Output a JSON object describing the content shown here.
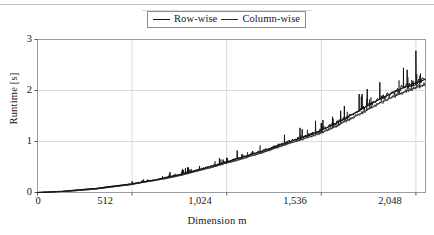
{
  "figure": {
    "background": "#ffffff",
    "frame_color": "#9a9da1",
    "grid_color": "#d9dbdd",
    "series_color_row": "#141414",
    "series_color_col": "#2d2d2d"
  },
  "legend": {
    "entries": [
      {
        "label": "Row-wise",
        "marker": "line-sample"
      },
      {
        "label": "Column-wise",
        "marker": "line-sample"
      }
    ]
  },
  "axes": {
    "y": {
      "label": "Runtime [s]",
      "ticks": [
        "0",
        "1",
        "2",
        "3"
      ]
    },
    "x": {
      "label": "Dimension m",
      "ticks": [
        "0",
        "512",
        "1,024",
        "1,536",
        "2,048"
      ]
    }
  },
  "chart_data": {
    "type": "line",
    "title": "",
    "xlabel": "Dimension m",
    "ylabel": "Runtime [s]",
    "xlim": [
      0,
      2100
    ],
    "ylim": [
      0,
      3
    ],
    "xticks": [
      0,
      512,
      1024,
      1536,
      2048
    ],
    "xticklabels": [
      "0",
      "512",
      "1,024",
      "1,536",
      "2,048"
    ],
    "yticks": [
      0,
      1,
      2,
      3
    ],
    "yticklabels": [
      "0",
      "1",
      "2",
      "3"
    ],
    "grid": true,
    "legend_position": "top-center-outside",
    "series": [
      {
        "name": "Row-wise",
        "color": "#141414",
        "x": [
          0,
          64,
          128,
          192,
          256,
          320,
          384,
          448,
          512,
          576,
          640,
          704,
          768,
          832,
          896,
          960,
          1024,
          1088,
          1152,
          1216,
          1280,
          1344,
          1408,
          1472,
          1536,
          1600,
          1664,
          1728,
          1792,
          1856,
          1920,
          1984,
          2048,
          2100
        ],
        "values": [
          0.0,
          0.01,
          0.02,
          0.04,
          0.06,
          0.08,
          0.11,
          0.14,
          0.17,
          0.21,
          0.25,
          0.3,
          0.35,
          0.41,
          0.47,
          0.53,
          0.6,
          0.67,
          0.74,
          0.81,
          0.89,
          0.97,
          1.05,
          1.13,
          1.22,
          1.33,
          1.45,
          1.58,
          1.71,
          1.84,
          1.95,
          2.06,
          2.15,
          2.22
        ]
      },
      {
        "name": "Column-wise",
        "color": "#2d2d2d",
        "x": [
          0,
          64,
          128,
          192,
          256,
          320,
          384,
          448,
          512,
          576,
          640,
          704,
          768,
          832,
          896,
          960,
          1024,
          1088,
          1152,
          1216,
          1280,
          1344,
          1408,
          1472,
          1536,
          1600,
          1664,
          1728,
          1792,
          1856,
          1920,
          1984,
          2048,
          2100
        ],
        "values": [
          0.0,
          0.01,
          0.02,
          0.03,
          0.05,
          0.07,
          0.1,
          0.13,
          0.16,
          0.2,
          0.24,
          0.28,
          0.33,
          0.39,
          0.45,
          0.51,
          0.58,
          0.64,
          0.71,
          0.78,
          0.86,
          0.94,
          1.01,
          1.09,
          1.17,
          1.27,
          1.39,
          1.51,
          1.63,
          1.76,
          1.87,
          1.97,
          2.06,
          2.12
        ]
      }
    ],
    "spikes": [
      {
        "x": 512,
        "y": 0.22
      },
      {
        "x": 1024,
        "y": 0.68
      },
      {
        "x": 1280,
        "y": 0.92
      },
      {
        "x": 1536,
        "y": 1.36
      },
      {
        "x": 2048,
        "y": 2.78
      }
    ]
  }
}
